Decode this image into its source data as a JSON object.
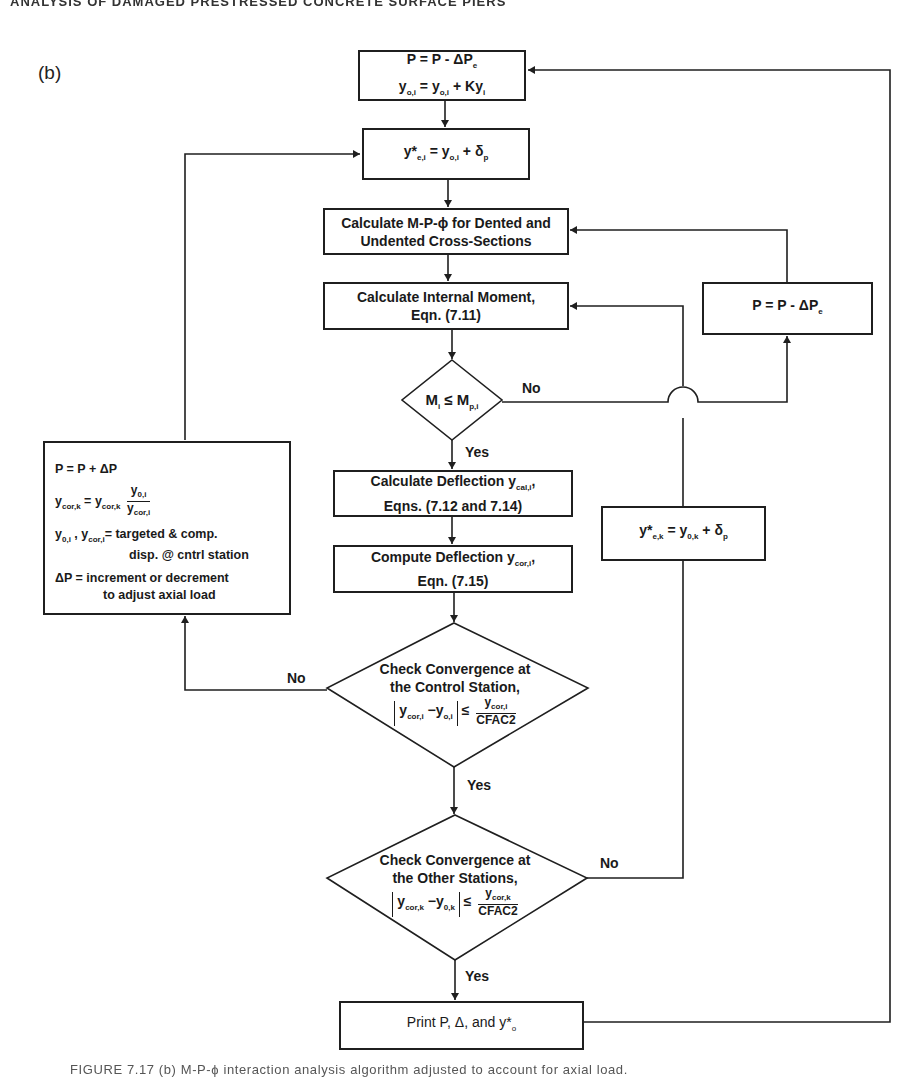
{
  "header": {
    "running_head": "ANALYSIS OF DAMAGED PRESTRESSED CONCRETE SURFACE PIERS"
  },
  "panel_label": "(b)",
  "nodes": {
    "update_load_top": {
      "line1": "P = P - ΔP",
      "line1_sub": "e",
      "line2_a": "y",
      "line2_a_sub": "o,i",
      "line2_b": " = y",
      "line2_b_sub": "o,i",
      "line2_c": " + Ky",
      "line2_c_sub": "i"
    },
    "initial_deflection": {
      "base": "y*",
      "sub1": "e,i",
      "mid": " = y",
      "sub2": "o,i",
      "end": " + δ",
      "sub3": "p"
    },
    "calc_mpphi": {
      "line1": "Calculate M-P-ϕ for Dented and",
      "line2": "Undented Cross-Sections"
    },
    "calc_moment": {
      "line1": "Calculate Internal Moment,",
      "line2": "Eqn. (7.11)"
    },
    "decision_moment": {
      "a": "M",
      "a_sub": "i",
      "op": " ≤ M",
      "b_sub": "p,i"
    },
    "reduce_load_right": {
      "text": "P = P - ΔP",
      "sub": "e"
    },
    "adjust_load_left": {
      "row1": "P = P + ΔP",
      "row2_lhs": "y",
      "row2_lhs_sub": "cor,k",
      "row2_eq": " = y",
      "row2_rhs_sub": "cor,k",
      "row2_num": "y",
      "row2_num_sub": "0,i",
      "row2_den": "y",
      "row2_den_sub": "cor,i",
      "row3_a": "y",
      "row3_a_sub": "0,i",
      "row3_b": " , y",
      "row3_b_sub": "cor,i",
      "row3_text": "= targeted & comp.",
      "row4": "disp. @ cntrl station",
      "row5_a": "ΔP = ",
      "row5_b": "increment or decrement",
      "row6": "to adjust axial load"
    },
    "calc_deflection": {
      "line1": "Calculate Deflection y",
      "line1_sub": "cal,i",
      "line1_end": ",",
      "line2": "Eqns. (7.12 and 7.14)"
    },
    "compute_deflection": {
      "line1": "Compute Deflection y",
      "line1_sub": "cor,i",
      "line1_end": ",",
      "line2": "Eqn. (7.15)"
    },
    "reset_deflection_right": {
      "base": "y*",
      "sub1": "e,k",
      "mid": " = y",
      "sub2": "0,k",
      "end": " + δ",
      "sub3": "p"
    },
    "decision_control": {
      "line1": "Check Convergence at",
      "line2": "the Control Station,",
      "lhs_a": "y",
      "lhs_a_sub": "cor,i",
      "lhs_b": " −y",
      "lhs_b_sub": "o,i",
      "rel": " ≤ ",
      "num": "y",
      "num_sub": "cor,i",
      "den": "CFAC2"
    },
    "decision_other": {
      "line1": "Check Convergence at",
      "line2": "the Other Stations,",
      "lhs_a": "y",
      "lhs_a_sub": "cor,k",
      "lhs_b": " −y",
      "lhs_b_sub": "0,k",
      "rel": " ≤ ",
      "num": "y",
      "num_sub": "cor,k",
      "den": "CFAC2"
    },
    "print_results": {
      "text": "Print P, Δ, and y*",
      "sub": "o"
    }
  },
  "edge_labels": {
    "moment_no": "No",
    "moment_yes": "Yes",
    "control_no": "No",
    "control_yes": "Yes",
    "other_no": "No",
    "other_yes": "Yes"
  },
  "caption": "FIGURE 7.17   (b) M-P-ϕ interaction analysis algorithm adjusted to account for axial load."
}
